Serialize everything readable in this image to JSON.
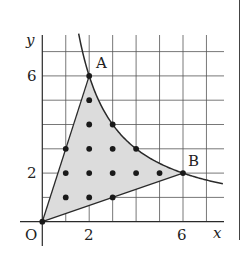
{
  "diagram": {
    "type": "coordinate-plane",
    "axes": {
      "x_label": "x",
      "y_label": "y",
      "origin_label": "O",
      "x_ticks": [
        {
          "value": 2,
          "label": "2"
        },
        {
          "value": 6,
          "label": "6"
        }
      ],
      "y_ticks": [
        {
          "value": 2,
          "label": "2"
        },
        {
          "value": 6,
          "label": "6"
        }
      ],
      "grid_max": 7
    },
    "curve": {
      "equation": "y = 12/x",
      "x_range": [
        1.55,
        7.72
      ]
    },
    "points": [
      {
        "name": "A",
        "label": "A",
        "x": 2,
        "y": 6
      },
      {
        "name": "B",
        "label": "B",
        "x": 6,
        "y": 2
      },
      {
        "name": "O",
        "label": "O",
        "x": 0,
        "y": 0
      }
    ],
    "shaded_region": "Region bounded by segments OA, OB and the curve y=12/x between A and B",
    "lattice_points": [
      [
        0,
        0
      ],
      [
        1,
        1
      ],
      [
        2,
        1
      ],
      [
        3,
        1
      ],
      [
        1,
        2
      ],
      [
        2,
        2
      ],
      [
        3,
        2
      ],
      [
        4,
        2
      ],
      [
        5,
        2
      ],
      [
        6,
        2
      ],
      [
        1,
        3
      ],
      [
        2,
        3
      ],
      [
        3,
        3
      ],
      [
        4,
        3
      ],
      [
        2,
        4
      ],
      [
        3,
        4
      ],
      [
        2,
        5
      ],
      [
        2,
        6
      ]
    ],
    "colors": {
      "shade": "#dcdcdc",
      "line": "#2a2a2a",
      "grid": "#555555",
      "point": "#1a1a1a"
    }
  }
}
